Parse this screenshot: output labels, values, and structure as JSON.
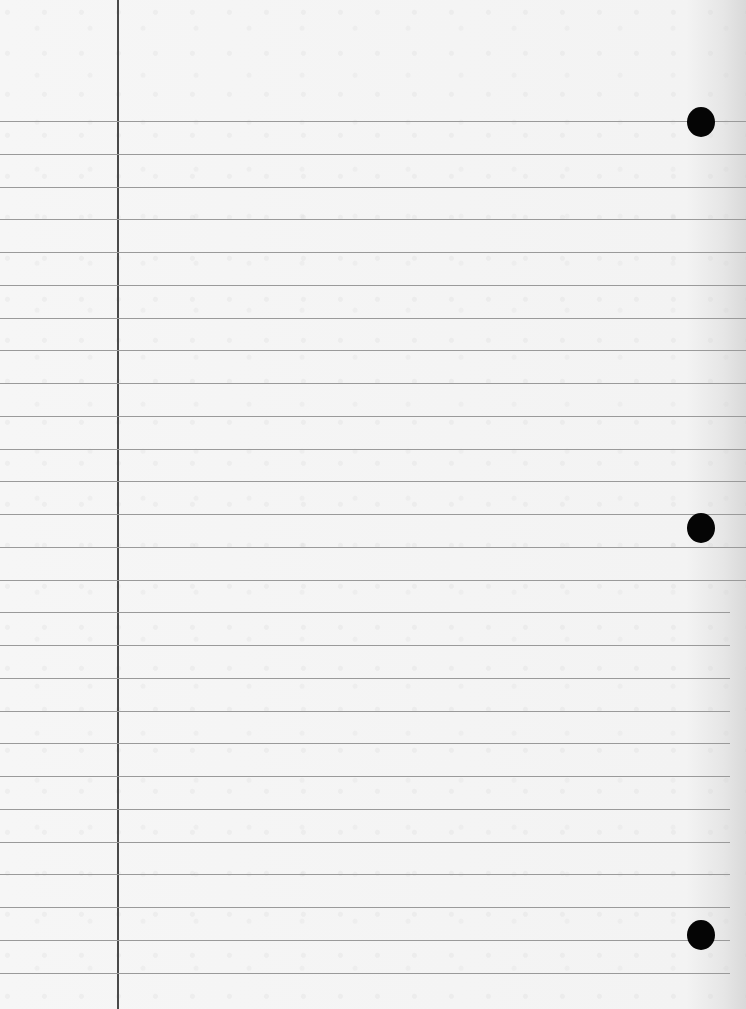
{
  "paper": {
    "type": "lined-notebook-paper",
    "background_color": "#f4f4f4",
    "rule_color": "#9a9a9a",
    "margin_color": "#4a4a4a",
    "hole_color": "#050505",
    "first_rule_y": 121,
    "rule_spacing": 32.75,
    "rule_count": 27,
    "margin_x": 117,
    "holes": [
      {
        "cx": 701,
        "cy": 122
      },
      {
        "cx": 701,
        "cy": 528
      },
      {
        "cx": 701,
        "cy": 935
      }
    ]
  }
}
